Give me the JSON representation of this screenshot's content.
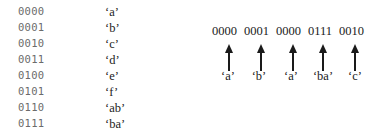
{
  "codebook": {
    "entries": [
      {
        "code": "0000",
        "symbol": "‘a’"
      },
      {
        "code": "0001",
        "symbol": "‘b’"
      },
      {
        "code": "0010",
        "symbol": "‘c’"
      },
      {
        "code": "0011",
        "symbol": "‘d’"
      },
      {
        "code": "0100",
        "symbol": "‘e’"
      },
      {
        "code": "0101",
        "symbol": "‘f’"
      },
      {
        "code": "0110",
        "symbol": "‘ab’"
      },
      {
        "code": "0111",
        "symbol": "‘ba’"
      }
    ]
  },
  "encoded_stream": {
    "codes": [
      "0000",
      "0001",
      "0000",
      "0111",
      "0010"
    ],
    "decoded": [
      "‘a’",
      "‘b’",
      "‘a’",
      "‘ba’",
      "‘c’"
    ]
  },
  "colors": {
    "code_text": "#6b6b6b",
    "symbol_text": "#222222",
    "arrow": "#1a1a1a"
  }
}
